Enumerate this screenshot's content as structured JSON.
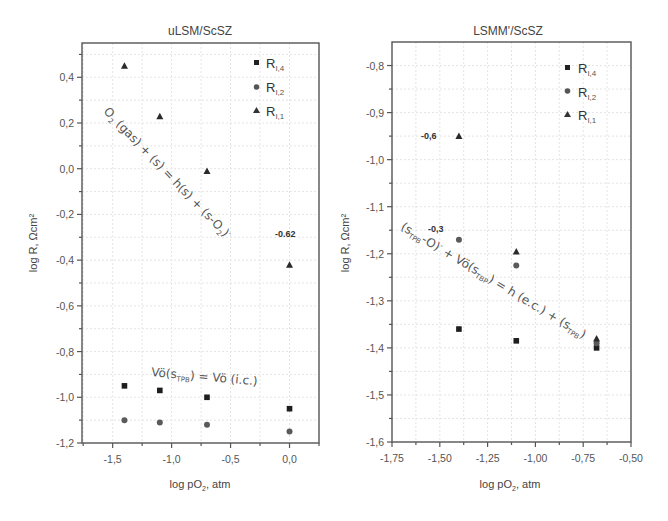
{
  "chart_data": [
    {
      "type": "scatter",
      "title": "uLSM/ScSZ",
      "xlabel": "log pO2, atm",
      "ylabel": "log R, Ωcm²",
      "xlim": [
        -1.76,
        0.25
      ],
      "ylim": [
        -1.2,
        0.55
      ],
      "xticks": [
        -1.5,
        -1.0,
        -0.5,
        0.0
      ],
      "xtick_labels": [
        "-1,5",
        "-1,0",
        "-0,5",
        "0,0"
      ],
      "yticks": [
        0.4,
        0.2,
        0.0,
        -0.2,
        -0.4,
        -0.6,
        -0.8,
        -1.0,
        -1.2
      ],
      "ytick_labels": [
        "0,4",
        "0,2",
        "0,0",
        "-0,2",
        "-0,4",
        "-0,6",
        "-0,8",
        "-1,0",
        "-1,2"
      ],
      "grid": true,
      "legend_position": "upper right",
      "series": [
        {
          "name": "R_I,4",
          "label_main": "R",
          "label_sub": "I,4",
          "marker": "square",
          "x": [
            -1.4,
            -1.1,
            -0.7,
            0.0
          ],
          "y": [
            -0.95,
            -0.97,
            -1.0,
            -1.05
          ]
        },
        {
          "name": "R_I,2",
          "label_main": "R",
          "label_sub": "I,2",
          "marker": "circle",
          "x": [
            -1.4,
            -1.1,
            -0.7,
            0.0
          ],
          "y": [
            -1.1,
            -1.11,
            -1.12,
            -1.15
          ]
        },
        {
          "name": "R_I,1",
          "label_main": "R",
          "label_sub": "I,1",
          "marker": "triangle",
          "x": [
            -1.4,
            -1.1,
            -0.7,
            0.0
          ],
          "y": [
            0.45,
            0.23,
            -0.01,
            -0.42
          ]
        }
      ],
      "annotations": [
        {
          "text": "O₂ (gas) + (s) = h(s) + (s-O₂)⁻",
          "x": -1.55,
          "y": 0.13,
          "rotate": 45
        },
        {
          "text": "Vö(sTPB) = Vö (i.c.)",
          "x": -0.95,
          "y": -0.92,
          "rotate": 5
        },
        {
          "text": "-0.62",
          "x": -0.12,
          "y": -0.33,
          "bold": true
        }
      ]
    },
    {
      "type": "scatter",
      "title": "LSMM'/ScSZ",
      "xlabel": "log pO2, atm",
      "ylabel": "log R, Ωcm²",
      "xlim": [
        -1.75,
        -0.5
      ],
      "ylim": [
        -1.6,
        -0.75
      ],
      "xticks": [
        -1.75,
        -1.5,
        -1.25,
        -1.0,
        -0.75,
        -0.5
      ],
      "xtick_labels": [
        "-1,75",
        "-1,50",
        "-1,25",
        "-1,00",
        "-0,75",
        "-0,50"
      ],
      "yticks": [
        -0.8,
        -0.9,
        -1.0,
        -1.1,
        -1.2,
        -1.3,
        -1.4,
        -1.5,
        -1.6
      ],
      "ytick_labels": [
        "-0,8",
        "-0,9",
        "-1,0",
        "-1,1",
        "-1,2",
        "-1,3",
        "-1,4",
        "-1,5",
        "-1,6"
      ],
      "grid": true,
      "legend_position": "upper right",
      "series": [
        {
          "name": "R_I,4",
          "label_main": "R",
          "label_sub": "I,4",
          "marker": "square",
          "x": [
            -1.4,
            -1.1,
            -0.68
          ],
          "y": [
            -1.36,
            -1.385,
            -1.4
          ]
        },
        {
          "name": "R_I,2",
          "label_main": "R",
          "label_sub": "I,2",
          "marker": "circle",
          "x": [
            -1.4,
            -1.1,
            -0.68
          ],
          "y": [
            -1.17,
            -1.225,
            -1.39
          ]
        },
        {
          "name": "R_I,1",
          "label_main": "R",
          "label_sub": "I,1",
          "marker": "triangle",
          "x": [
            -1.4,
            -1.1,
            -0.68
          ],
          "y": [
            -0.95,
            -1.195,
            -1.38
          ]
        }
      ],
      "annotations": [
        {
          "text": "(sTPB-O)⁻ + Vö(sTBP) = h (e.c.) + (sTPB)",
          "x": -1.72,
          "y": -1.19,
          "rotate": 31
        },
        {
          "text": "-0,6",
          "x": -1.55,
          "y": -0.95,
          "bold": true
        },
        {
          "text": "-0,3",
          "x": -1.5,
          "y": -1.165,
          "bold": true
        }
      ]
    }
  ],
  "charts": {
    "left": {
      "title": "uLSM/ScSZ",
      "ylabel": "log R, Ωcm²",
      "xlabel_main": "log pO",
      "xlabel_sub": "2",
      "xlabel_tail": ", atm",
      "anno_main_parts": [
        "O",
        "2",
        " (gas) + (s) = h(s) + (s-O",
        "2",
        ")",
        "-"
      ],
      "anno_vo_parts": [
        "Vö(s",
        "TPB",
        ") = Vö (i.c.)"
      ],
      "value_label": "-0.62"
    },
    "right": {
      "title": "LSMM'/ScSZ",
      "ylabel": "log R, Ωcm²",
      "xlabel_main": "log pO",
      "xlabel_sub": "2",
      "xlabel_tail": ", atm",
      "anno_main_parts": [
        "(s",
        "TPB",
        "-O)",
        "-",
        " + Vö(s",
        "TBP",
        ") = h (e.c.) + (s",
        "TPB",
        ")"
      ],
      "value_label_1": "-0,6",
      "value_label_2": "-0,3"
    }
  }
}
